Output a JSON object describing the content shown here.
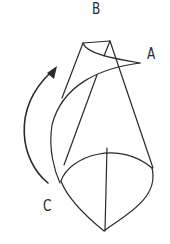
{
  "diagram": {
    "labels": {
      "a": "A",
      "b": "B",
      "c": "C"
    },
    "colors": {
      "stroke": "#2a2a2a",
      "background": "#ffffff"
    }
  }
}
